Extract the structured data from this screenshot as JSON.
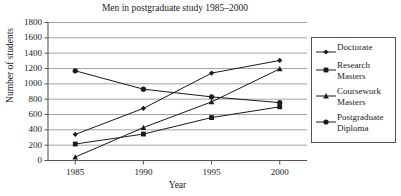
{
  "chart_data": {
    "type": "line",
    "title": "Men in postgraduate study 1985–2000",
    "xlabel": "Year",
    "ylabel": "Number of students",
    "categories": [
      "1985",
      "1990",
      "1995",
      "2000"
    ],
    "x": [
      1985,
      1990,
      1995,
      2000
    ],
    "xlim": [
      1983,
      2002
    ],
    "ylim": [
      0,
      1800
    ],
    "yticks": [
      "0",
      "200",
      "400",
      "600",
      "800",
      "1000",
      "1200",
      "1400",
      "1600",
      "1800"
    ],
    "ytick_values": [
      0,
      200,
      400,
      600,
      800,
      1000,
      1200,
      1400,
      1600,
      1800
    ],
    "grid": "horizontal",
    "legend_position": "right",
    "series": [
      {
        "name": "Doctorate",
        "marker": "diamond",
        "color": "#1a1a1a",
        "values": [
          340,
          680,
          1140,
          1305
        ]
      },
      {
        "name": "Research Masters",
        "marker": "square",
        "color": "#1a1a1a",
        "values": [
          215,
          345,
          560,
          700
        ]
      },
      {
        "name": "Coursework Masters",
        "marker": "triangle",
        "color": "#1a1a1a",
        "values": [
          45,
          430,
          765,
          1195
        ]
      },
      {
        "name": "Postgraduate Diploma",
        "marker": "circle",
        "color": "#1a1a1a",
        "values": [
          1170,
          930,
          830,
          755
        ]
      }
    ]
  },
  "legend": {
    "entries": [
      {
        "label": "Doctorate",
        "marker": "diamond"
      },
      {
        "label": "Research\nMasters",
        "marker": "square"
      },
      {
        "label": "Coursework\nMasters",
        "marker": "triangle"
      },
      {
        "label": "Postgraduate\nDiploma",
        "marker": "circle"
      }
    ]
  },
  "style": {
    "axis_color": "#555555",
    "grid_color": "#8c8c8c",
    "line_color": "#1a1a1a",
    "background": "#ffffff"
  }
}
